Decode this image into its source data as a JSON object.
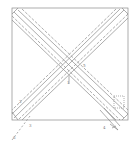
{
  "figure": {
    "type": "patent-line-drawing",
    "stroke_color": "#8a8a8a",
    "background": "#ffffff",
    "labels": [
      {
        "text": "5",
        "x": 83,
        "y": 66
      },
      {
        "text": "1",
        "x": 68,
        "y": 82
      },
      {
        "text": "2",
        "x": 19,
        "y": 102
      },
      {
        "text": "3",
        "x": 30,
        "y": 126
      },
      {
        "text": "4",
        "x": 104,
        "y": 128
      },
      {
        "text": "6",
        "x": 14,
        "y": 138
      }
    ]
  }
}
